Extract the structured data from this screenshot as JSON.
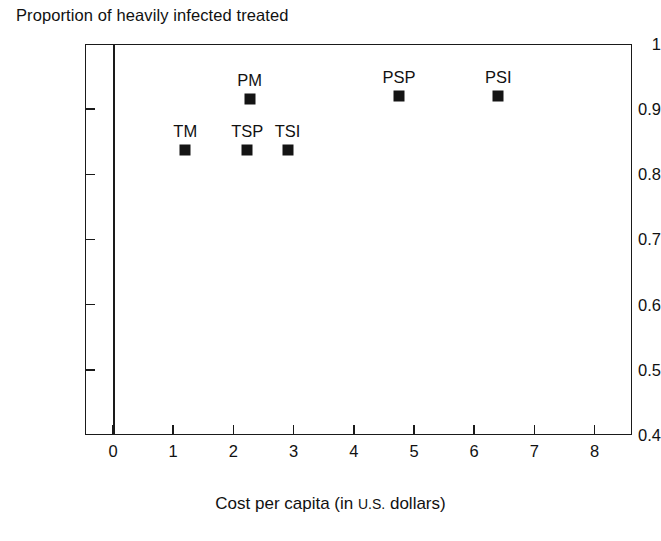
{
  "chart_data": {
    "type": "scatter",
    "title": "",
    "ylabel": "Proportion of heavily infected treated",
    "xlabel": "Cost per capita (in U.S. dollars)",
    "xlabel_parts": {
      "before": "Cost per capita (in ",
      "smallcaps": "U.S.",
      "after": " dollars)"
    },
    "xlim": [
      0,
      8.6
    ],
    "ylim": [
      0.4,
      1.0
    ],
    "grid": false,
    "legend": "none",
    "x_ticks": [
      "0",
      "1",
      "2",
      "3",
      "4",
      "5",
      "6",
      "7",
      "8"
    ],
    "x_tick_values": [
      0,
      1,
      2,
      3,
      4,
      5,
      6,
      7,
      8
    ],
    "y_ticks": [
      "1",
      "0.9",
      "0.8",
      "0.7",
      "0.6",
      "0.5",
      "0.4"
    ],
    "y_tick_values": [
      1.0,
      0.9,
      0.8,
      0.7,
      0.6,
      0.5,
      0.4
    ],
    "marker": "filled-square",
    "marker_color": "#141414",
    "points": [
      {
        "label": "TM",
        "x": 1.2,
        "y": 0.837
      },
      {
        "label": "TSP",
        "x": 2.23,
        "y": 0.837
      },
      {
        "label": "TSI",
        "x": 2.9,
        "y": 0.837
      },
      {
        "label": "PM",
        "x": 2.27,
        "y": 0.915
      },
      {
        "label": "PSP",
        "x": 4.75,
        "y": 0.92
      },
      {
        "label": "PSI",
        "x": 6.4,
        "y": 0.92
      }
    ]
  }
}
